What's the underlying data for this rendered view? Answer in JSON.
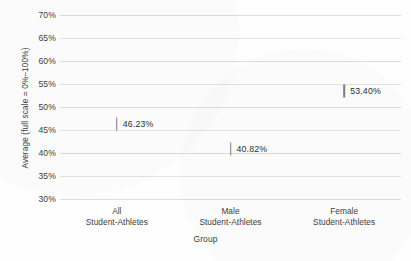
{
  "chart_data": {
    "type": "scatter",
    "title": "",
    "xlabel": "Group",
    "ylabel": "Average (full scale = 0%–100%)",
    "categories": [
      "All\nStudent-Athletes",
      "Male\nStudent-Athletes",
      "Female\nStudent-Athletes"
    ],
    "category_lines": [
      {
        "line1": "All",
        "line2": "Student-Athletes"
      },
      {
        "line1": "Male",
        "line2": "Student-Athletes"
      },
      {
        "line1": "Female",
        "line2": "Student-Athletes"
      }
    ],
    "values": [
      46.23,
      40.82,
      53.4
    ],
    "data_labels": [
      "46.23%",
      "40.82%",
      "53.40%"
    ],
    "ylim": [
      30,
      70
    ],
    "ytick_step": 5,
    "ytick_labels": [
      "70%",
      "65%",
      "60%",
      "55%",
      "50%",
      "45%",
      "40%",
      "35%",
      "30%"
    ],
    "ytick_values": [
      70,
      65,
      60,
      55,
      50,
      45,
      40,
      35,
      30
    ],
    "grid": true,
    "grid_axis": "y",
    "legend": "none",
    "marker_style": "vertical-tick",
    "colors": {
      "marker": "#7d7d7d",
      "gridline": "#dddddd",
      "text": "#3d3d3d",
      "background": "#fefefe"
    }
  }
}
